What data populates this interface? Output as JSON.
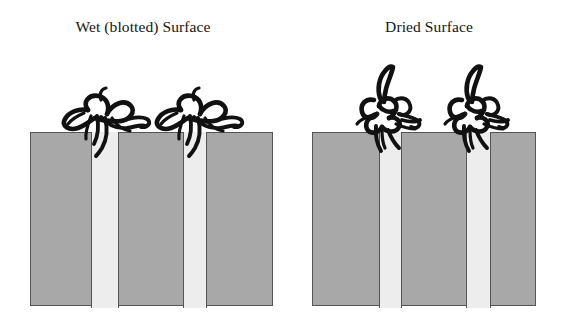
{
  "figure": {
    "caption_present": false,
    "background_color": "#ffffff",
    "width": 572,
    "height": 324
  },
  "colors": {
    "substrate_fill": "#a8a8a8",
    "pore_fill": "#ededed",
    "outline": "#545454",
    "organism_stroke": "#111111",
    "text": "#141414"
  },
  "panels": [
    {
      "id": "wet",
      "title": "Wet (blotted) Surface",
      "substrate": {
        "label": "porous-substrate-block",
        "x": 30,
        "y": 132,
        "width": 243,
        "height": 174
      },
      "pores": [
        {
          "label": "pore-channel-left",
          "x": 60,
          "width": 28
        },
        {
          "label": "pore-channel-right",
          "x": 152,
          "width": 24
        }
      ],
      "organisms": [
        {
          "label": "organism-spread-left",
          "morphology": "spread",
          "x": 55,
          "y": 82
        },
        {
          "label": "organism-spread-right",
          "morphology": "spread",
          "x": 148,
          "y": 82
        }
      ]
    },
    {
      "id": "dried",
      "title": "Dried Surface",
      "substrate": {
        "label": "porous-substrate-block",
        "x": 26,
        "y": 132,
        "width": 224,
        "height": 174
      },
      "pores": [
        {
          "label": "pore-channel-left",
          "x": 66,
          "width": 23
        },
        {
          "label": "pore-channel-right",
          "x": 153,
          "width": 25
        }
      ],
      "organisms": [
        {
          "label": "organism-collapsed-left",
          "morphology": "collapsed",
          "x": 60,
          "y": 64
        },
        {
          "label": "organism-collapsed-right",
          "morphology": "collapsed",
          "x": 148,
          "y": 64
        }
      ]
    }
  ]
}
